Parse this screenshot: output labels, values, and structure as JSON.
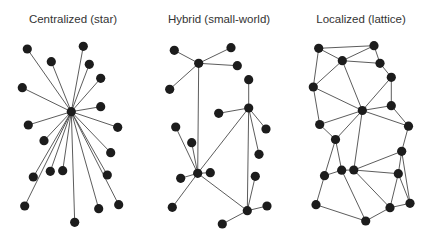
{
  "panels": [
    {
      "title": "Centralized (star)",
      "title_center_x": 73,
      "nodes": [
        [
          71.3,
          111.7
        ],
        [
          27.3,
          49
        ],
        [
          83.3,
          46.3
        ],
        [
          51.3,
          61.7
        ],
        [
          89.3,
          64.3
        ],
        [
          100.7,
          78.3
        ],
        [
          22.3,
          87.7
        ],
        [
          100.7,
          106.7
        ],
        [
          28.3,
          125
        ],
        [
          117.7,
          127.3
        ],
        [
          44,
          140.7
        ],
        [
          110.7,
          152.7
        ],
        [
          33.3,
          177
        ],
        [
          50.3,
          171.3
        ],
        [
          62.7,
          170.7
        ],
        [
          107.3,
          175
        ],
        [
          24.7,
          206
        ],
        [
          98.7,
          208.7
        ],
        [
          118.7,
          204.7
        ],
        [
          74.7,
          222.3
        ]
      ],
      "edges": [
        [
          0,
          1
        ],
        [
          0,
          2
        ],
        [
          0,
          3
        ],
        [
          0,
          4
        ],
        [
          0,
          5
        ],
        [
          0,
          6
        ],
        [
          0,
          7
        ],
        [
          0,
          8
        ],
        [
          0,
          9
        ],
        [
          0,
          10
        ],
        [
          0,
          11
        ],
        [
          0,
          12
        ],
        [
          0,
          13
        ],
        [
          0,
          14
        ],
        [
          0,
          15
        ],
        [
          0,
          16
        ],
        [
          0,
          17
        ],
        [
          0,
          18
        ],
        [
          0,
          19
        ]
      ]
    },
    {
      "title": "Hybrid (small-world)",
      "title_center_x": 219,
      "nodes": [
        [
          198.7,
          63.3
        ],
        [
          174.3,
          50.3
        ],
        [
          231,
          47.7
        ],
        [
          237.3,
          65.7
        ],
        [
          169.7,
          89.3
        ],
        [
          248.7,
          79.7
        ],
        [
          248.7,
          108
        ],
        [
          218.7,
          113.3
        ],
        [
          259,
          154.3
        ],
        [
          255.3,
          176.3
        ],
        [
          197.7,
          173.3
        ],
        [
          175.7,
          127
        ],
        [
          191.7,
          142.7
        ],
        [
          210.3,
          172.7
        ],
        [
          180.7,
          178.3
        ],
        [
          172.3,
          207.3
        ],
        [
          247.3,
          210.7
        ],
        [
          267,
          206
        ],
        [
          222.3,
          224
        ],
        [
          266,
          129
        ]
      ],
      "edges": [
        [
          0,
          1
        ],
        [
          0,
          2
        ],
        [
          0,
          3
        ],
        [
          0,
          4
        ],
        [
          0,
          10
        ],
        [
          6,
          5
        ],
        [
          6,
          7
        ],
        [
          6,
          19
        ],
        [
          6,
          8
        ],
        [
          6,
          16
        ],
        [
          6,
          10
        ],
        [
          10,
          11
        ],
        [
          10,
          12
        ],
        [
          10,
          13
        ],
        [
          10,
          14
        ],
        [
          10,
          15
        ],
        [
          10,
          16
        ],
        [
          16,
          9
        ],
        [
          16,
          17
        ],
        [
          16,
          18
        ]
      ]
    },
    {
      "title": "Localized (lattice)",
      "title_center_x": 361,
      "nodes": [
        [
          318.7,
          48.3
        ],
        [
          374,
          45.7
        ],
        [
          342.3,
          60.7
        ],
        [
          380,
          63.3
        ],
        [
          391.3,
          77.3
        ],
        [
          313.3,
          87
        ],
        [
          362.3,
          110.5
        ],
        [
          391.3,
          105.7
        ],
        [
          319.7,
          124.5
        ],
        [
          335.5,
          139.5
        ],
        [
          408.5,
          126.2
        ],
        [
          401.7,
          151.3
        ],
        [
          341.7,
          170.2
        ],
        [
          353.8,
          170
        ],
        [
          398.3,
          173.7
        ],
        [
          324.5,
          175.7
        ],
        [
          316,
          204.7
        ],
        [
          390,
          207.7
        ],
        [
          410,
          203.3
        ],
        [
          365.7,
          221
        ]
      ],
      "edges": [
        [
          0,
          1
        ],
        [
          0,
          2
        ],
        [
          0,
          5
        ],
        [
          1,
          2
        ],
        [
          1,
          3
        ],
        [
          2,
          3
        ],
        [
          2,
          5
        ],
        [
          2,
          6
        ],
        [
          3,
          4
        ],
        [
          4,
          6
        ],
        [
          4,
          7
        ],
        [
          5,
          6
        ],
        [
          5,
          8
        ],
        [
          6,
          7
        ],
        [
          6,
          8
        ],
        [
          6,
          9
        ],
        [
          6,
          10
        ],
        [
          6,
          13
        ],
        [
          7,
          10
        ],
        [
          8,
          9
        ],
        [
          9,
          12
        ],
        [
          9,
          15
        ],
        [
          10,
          11
        ],
        [
          11,
          13
        ],
        [
          11,
          14
        ],
        [
          11,
          18
        ],
        [
          12,
          13
        ],
        [
          12,
          15
        ],
        [
          12,
          19
        ],
        [
          13,
          14
        ],
        [
          13,
          17
        ],
        [
          14,
          17
        ],
        [
          14,
          18
        ],
        [
          15,
          16
        ],
        [
          16,
          19
        ],
        [
          17,
          18
        ],
        [
          17,
          19
        ]
      ]
    }
  ],
  "style": {
    "node_color": "#1c1c1c",
    "edge_color": "#4a4a4a",
    "node_radius": 4.6
  }
}
